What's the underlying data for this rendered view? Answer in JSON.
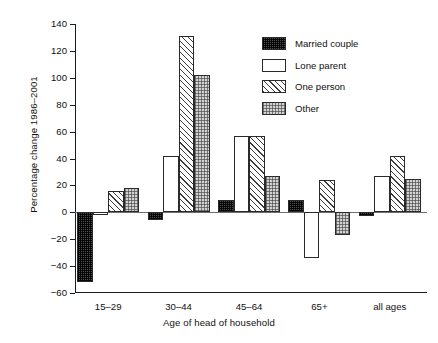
{
  "chart_data": {
    "type": "bar",
    "title": "",
    "xlabel": "Age of head of household",
    "ylabel": "Percentage change 1986–2001",
    "categories": [
      "15–29",
      "30–44",
      "45–64",
      "65+",
      "all ages"
    ],
    "series": [
      {
        "name": "Married couple",
        "values": [
          -52,
          -6,
          9,
          9,
          -3
        ],
        "pattern": "dark-checker"
      },
      {
        "name": "Lone parent",
        "values": [
          -2,
          42,
          57,
          -34,
          27
        ],
        "pattern": "light-stipple"
      },
      {
        "name": "One person",
        "values": [
          16,
          131,
          57,
          24,
          42
        ],
        "pattern": "diagonal-hatch"
      },
      {
        "name": "Other",
        "values": [
          18,
          102,
          27,
          -17,
          25
        ],
        "pattern": "grey-dots"
      }
    ],
    "ylim": [
      -60,
      140
    ],
    "ytick_step": 20,
    "yticks": [
      -60,
      -40,
      -20,
      0,
      20,
      40,
      60,
      80,
      100,
      120,
      140
    ],
    "ytick_labels": [
      "−60",
      "−40",
      "−20",
      "0",
      "20",
      "40",
      "60",
      "80",
      "100",
      "120",
      "140"
    ],
    "grid": false,
    "zero_line": true,
    "legend_position": "top-right",
    "legend_entries": [
      "Married couple",
      "Lone parent",
      "One person",
      "Other"
    ]
  },
  "colors": {
    "axis": "#1c1c1c",
    "zero_line": "#6e6e6e",
    "married_couple": "#4a4a4a",
    "lone_parent": "#ffffff",
    "one_person": "#ffffff",
    "other": "#d2d2d2",
    "background": "#ffffff"
  }
}
